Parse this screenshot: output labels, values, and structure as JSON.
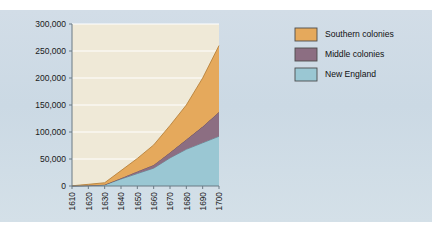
{
  "figure": {
    "panel_bg": "#cfdce6",
    "plot_bg": "#efe9d7",
    "gridline_color": "#ffffff",
    "axis_color": "#6b7a85"
  },
  "chart_data": {
    "type": "area",
    "stacked": true,
    "title": "",
    "subtitle": "",
    "xlabel": "",
    "ylabel": "",
    "x": [
      1610,
      1620,
      1630,
      1640,
      1650,
      1660,
      1670,
      1680,
      1690,
      1700
    ],
    "xlim": [
      1610,
      1700
    ],
    "ylim": [
      0,
      300000
    ],
    "yticks": [
      0,
      50000,
      100000,
      150000,
      200000,
      250000,
      300000
    ],
    "ytick_labels": [
      "0",
      "50,000",
      "100,000",
      "150,000",
      "200,000",
      "250,000",
      "300,000"
    ],
    "xticks": [
      1610,
      1620,
      1630,
      1640,
      1650,
      1660,
      1670,
      1680,
      1690,
      1700
    ],
    "xtick_labels": [
      "1610",
      "1620",
      "1630",
      "1640",
      "1650",
      "1660",
      "1670",
      "1680",
      "1690",
      "1700"
    ],
    "grid": true,
    "grid_axis": "y",
    "legend_position": "right",
    "series": [
      {
        "name": "New England",
        "color": "#9ac7d3",
        "edge_color": "#5f8e9c",
        "values": [
          0,
          500,
          2000,
          13000,
          23000,
          33000,
          52000,
          68000,
          80000,
          92000
        ]
      },
      {
        "name": "Middle colonies",
        "color": "#8c6e82",
        "edge_color": "#5d4456",
        "values": [
          0,
          300,
          500,
          1500,
          4000,
          6000,
          10000,
          18000,
          30000,
          45000
        ]
      },
      {
        "name": "Southern colonies",
        "color": "#e5a95c",
        "edge_color": "#b8823c",
        "values": [
          350,
          2300,
          3500,
          14000,
          24000,
          37000,
          50000,
          64000,
          90000,
          123000
        ]
      }
    ],
    "totals": [
      350,
      3100,
      6000,
      28500,
      51000,
      76000,
      112000,
      150000,
      200000,
      260000
    ]
  },
  "legend": {
    "entries": [
      {
        "label": "Southern colonies",
        "color": "#e5a95c"
      },
      {
        "label": "Middle colonies",
        "color": "#8c6e82"
      },
      {
        "label": "New England",
        "color": "#9ac7d3"
      }
    ]
  }
}
